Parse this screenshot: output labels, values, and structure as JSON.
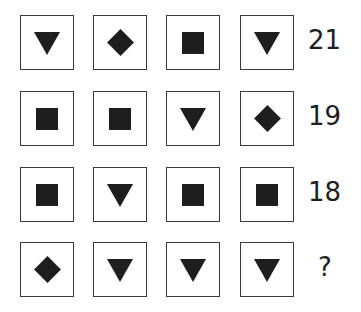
{
  "puzzle": {
    "rows": [
      {
        "shapes": [
          "triangle",
          "diamond",
          "square",
          "triangle"
        ],
        "value": "21"
      },
      {
        "shapes": [
          "square",
          "square",
          "triangle",
          "diamond"
        ],
        "value": "19"
      },
      {
        "shapes": [
          "square",
          "triangle",
          "square",
          "square"
        ],
        "value": "18"
      },
      {
        "shapes": [
          "diamond",
          "triangle",
          "triangle",
          "triangle"
        ],
        "value": "?"
      }
    ],
    "colors": {
      "shape": "#1e1e1e",
      "border": "#3a3a3a",
      "background": "#ffffff"
    }
  }
}
